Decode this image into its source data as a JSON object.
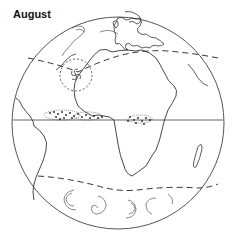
{
  "title": "August",
  "figure": {
    "features": [
      "globe-outline",
      "equator-line",
      "dashed-storm-track-north",
      "dashed-storm-track-south",
      "hurricane-circle",
      "itcz-cloud-band",
      "southern-ocean-vortices"
    ],
    "colors": {
      "line": "#333333",
      "background": "#ffffff"
    }
  }
}
